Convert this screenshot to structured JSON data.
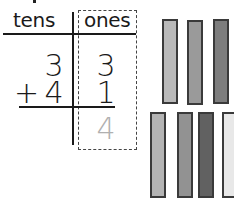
{
  "place_value_chart": {
    "headers": {
      "tens": "tens",
      "ones": "ones"
    },
    "rows": [
      {
        "operator": "",
        "tens": "3",
        "ones": "3"
      },
      {
        "operator": "+",
        "tens": "4",
        "ones": "1"
      }
    ],
    "answer": {
      "tens": "",
      "ones": "4"
    },
    "answer_color": "#b0b0b0"
  },
  "base_ten_model": {
    "top_row": {
      "count": 3,
      "colors": [
        "#b9b9b9",
        "#9a9a9a",
        "#7d7d7d"
      ]
    },
    "bottom_row": {
      "count": 4,
      "colors": [
        "#b4b4b4",
        "#929292",
        "#616161",
        "#e8e8e8"
      ]
    }
  }
}
